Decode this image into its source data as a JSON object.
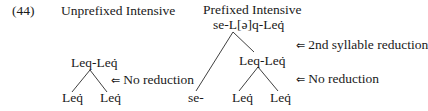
{
  "example_number": "(44)",
  "left_tree": {
    "title": "Unprefixed Intensive",
    "root": "Leq-Leq̇",
    "children": [
      "Leq̇",
      "Leq̇"
    ],
    "annotation": {
      "arrow": "⇐",
      "text": "No reduction"
    }
  },
  "right_tree": {
    "title": "Prefixed Intensive",
    "root": "se-L[ə]q-Leq̇",
    "root_annotation": {
      "arrow": "⇐",
      "text": "2nd syllable reduction"
    },
    "prefix": "se-",
    "inner_node": "Leq-Leq̇",
    "inner_annotation": {
      "arrow": "⇐",
      "text": "No reduction"
    },
    "children": [
      "Leq̇",
      "Leq̇"
    ]
  }
}
